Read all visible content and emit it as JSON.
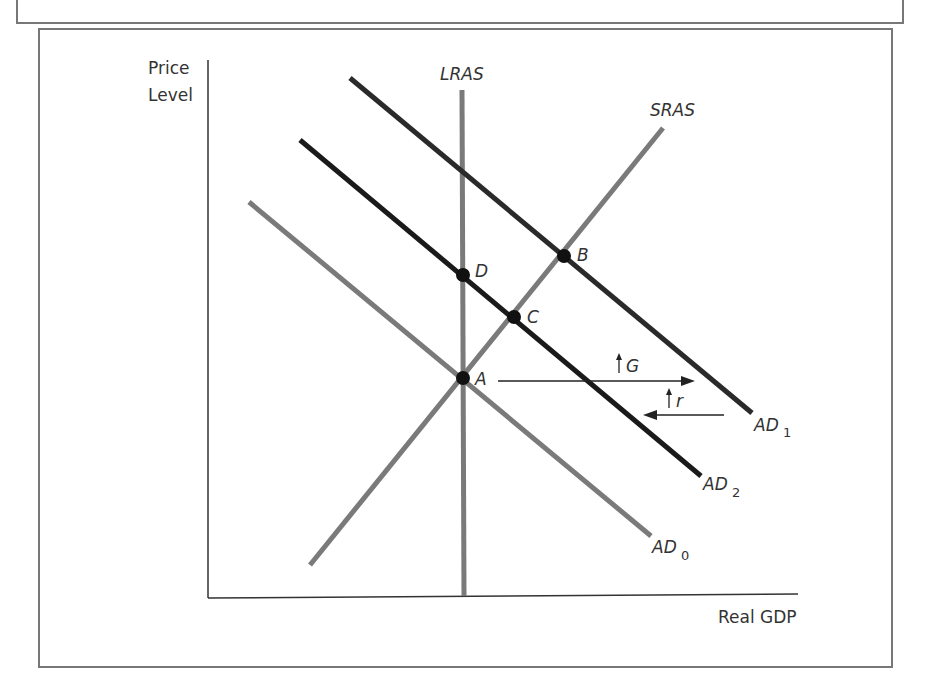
{
  "diagram": {
    "y_axis_label_line1": "Price",
    "y_axis_label_line2": "Level",
    "x_axis_label": "Real GDP",
    "curves": {
      "lras": "LRAS",
      "sras": "SRAS",
      "ad0": "AD",
      "ad0_sub": "0",
      "ad1": "AD",
      "ad1_sub": "1",
      "ad2": "AD",
      "ad2_sub": "2"
    },
    "points": {
      "a": "A",
      "b": "B",
      "c": "C",
      "d": "D"
    },
    "annotations": {
      "g_increase": "G",
      "r_increase": "r"
    },
    "colors": {
      "gray_curve": "#7a7a7a",
      "black_curve": "#1a1a1a",
      "frame": "#777777"
    }
  }
}
